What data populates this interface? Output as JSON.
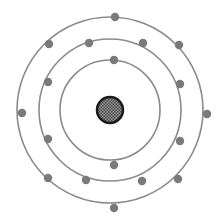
{
  "title": "",
  "colors": {
    "background": "#ffffff",
    "orbit": "#8a8a8a",
    "electron": "#7a7a7a",
    "nucleus_border": "#1a1a1a",
    "nucleus_fill": "#777777"
  },
  "atom": {
    "center": [
      110,
      110
    ],
    "nucleus_radius": 13,
    "shells": [
      {
        "radius": 50,
        "electron_count": 2,
        "electrons": [
          [
            114,
            60
          ],
          [
            114,
            165
          ]
        ]
      },
      {
        "radius": 71,
        "electron_count": 8,
        "electrons": [
          [
            89,
            43
          ],
          [
            143,
            43
          ],
          [
            48,
            82
          ],
          [
            180,
            84
          ],
          [
            48,
            139
          ],
          [
            180,
            141
          ],
          [
            86,
            180
          ],
          [
            142,
            181
          ]
        ]
      },
      {
        "radius": 93,
        "electron_count": 8,
        "electrons": [
          [
            115,
            17
          ],
          [
            49,
            44
          ],
          [
            179,
            45
          ],
          [
            22,
            113
          ],
          [
            207,
            114
          ],
          [
            48,
            178
          ],
          [
            178,
            179
          ],
          [
            114,
            208
          ]
        ]
      }
    ]
  }
}
